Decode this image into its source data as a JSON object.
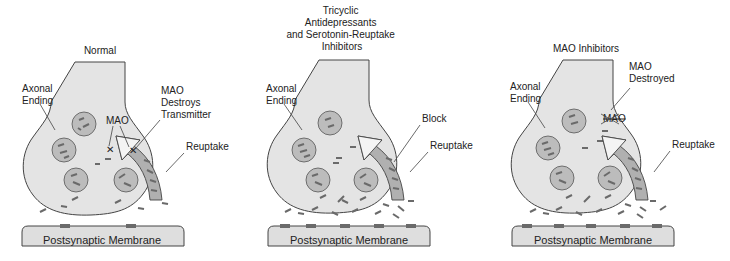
{
  "panels": [
    {
      "title": "Normal",
      "labels": {
        "axonal_ending": [
          "Axonal",
          "Ending"
        ],
        "mao": "MAO",
        "mao_action": [
          "MAO",
          "Destroys",
          "Transmitter"
        ],
        "reuptake": "Reuptake"
      },
      "membrane": "Postsynaptic Membrane"
    },
    {
      "title": [
        "Tricyclic",
        "Antidepressants",
        "and Serotonin-Reuptake",
        "Inhibitors"
      ],
      "labels": {
        "axonal_ending": [
          "Axonal",
          "Ending"
        ],
        "block": "Block",
        "reuptake": "Reuptake"
      },
      "membrane": "Postsynaptic Membrane"
    },
    {
      "title": "MAO Inhibitors",
      "labels": {
        "axonal_ending": [
          "Axonal",
          "Ending"
        ],
        "mao_destroyed": [
          "MAO",
          "Destroyed"
        ],
        "mao_crossed": "MAO",
        "reuptake": "Reuptake"
      },
      "membrane": "Postsynaptic Membrane"
    }
  ]
}
